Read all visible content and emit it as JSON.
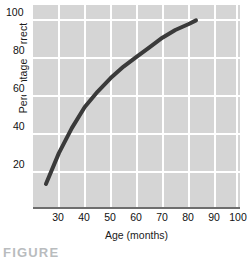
{
  "chart_data": {
    "type": "line",
    "title": "",
    "xlabel": "Age (months)",
    "ylabel": "Percentage correct",
    "xlim": [
      25,
      105
    ],
    "ylim": [
      0,
      105
    ],
    "xticks": [
      30,
      40,
      50,
      60,
      70,
      80,
      90,
      100
    ],
    "xtick_labels": [
      "30",
      "40",
      "50",
      "60",
      "70",
      "80",
      "90",
      "100"
    ],
    "yticks": [
      20,
      40,
      60,
      80,
      100
    ],
    "ytick_labels": [
      "20",
      "40",
      "60",
      "80",
      "100"
    ],
    "grid": true,
    "legend": false,
    "series": [
      {
        "name": "percentage correct",
        "x": [
          30,
          35,
          40,
          45,
          50,
          55,
          60,
          65,
          70,
          75,
          80,
          85,
          88
        ],
        "y": [
          12,
          28,
          41,
          52,
          60,
          67,
          73,
          78,
          83,
          88,
          92,
          95,
          97
        ]
      }
    ],
    "colors": {
      "panel_background": "#d5d5d5",
      "gridline": "#ffffff",
      "curve": "#3a3a3a",
      "axis_line": "#6e6e6e",
      "tick_text": "#111111",
      "caption_text": "#b9bcbe"
    }
  },
  "caption": {
    "text": "FIGURE"
  }
}
